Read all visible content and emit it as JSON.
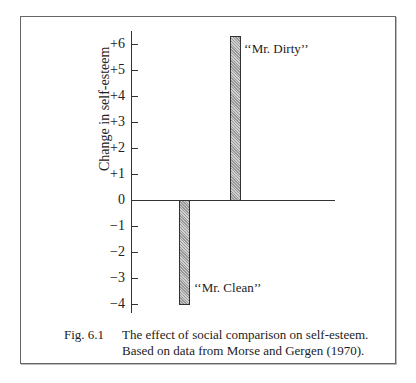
{
  "chart_data": {
    "type": "bar",
    "title": "",
    "xlabel": "",
    "ylabel": "Change in self-esteem",
    "categories": [
      "“Mr. Clean”",
      "“Mr. Dirty”"
    ],
    "values": [
      -4,
      6.3
    ],
    "ylim": [
      -4.5,
      6.5
    ],
    "yticks": [
      6,
      5,
      4,
      3,
      2,
      1,
      0,
      -1,
      -2,
      -3,
      -4
    ],
    "ytick_labels": [
      "+6",
      "+5",
      "+4",
      "+3",
      "+2",
      "+1",
      "0",
      "−1",
      "−2",
      "−3",
      "−4"
    ],
    "grid": false,
    "legend": "none",
    "bar_fill": "hatched grey"
  },
  "labels": {
    "ylabel": "Change in self-esteem",
    "mr_clean": "‘‘Mr. Clean’’",
    "mr_dirty": "‘‘Mr. Dirty’’"
  },
  "caption": {
    "fig_number": "Fig. 6.1",
    "line1": "The effect of social comparison on self-esteem.",
    "line2": "Based on data from Morse and Gergen (1970)."
  }
}
